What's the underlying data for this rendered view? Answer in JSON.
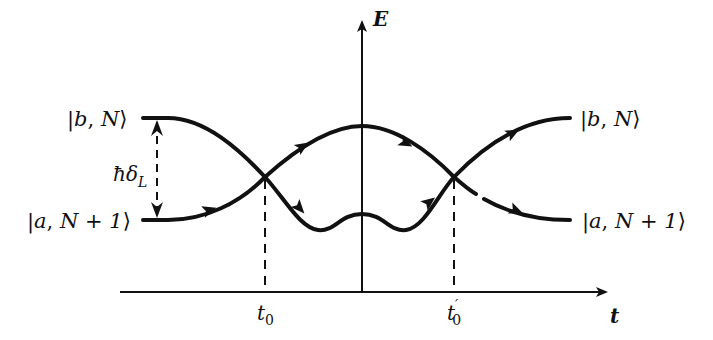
{
  "diagram": {
    "type": "energy-level-crossing",
    "axes": {
      "y_label": "E",
      "x_label": "t"
    },
    "time_markers": [
      {
        "label": "t",
        "subscript": "0",
        "prime": ""
      },
      {
        "label": "t",
        "subscript": "0",
        "prime": "′"
      }
    ],
    "left_states": {
      "upper": {
        "bar_left": "|",
        "var": "b",
        "sep": ", ",
        "n": "N",
        "close": "⟩"
      },
      "lower": {
        "bar_left": "|",
        "var": "a",
        "sep": ", ",
        "n": "N + 1",
        "close": "⟩"
      }
    },
    "right_states": {
      "upper": {
        "bar_left": "|",
        "var": "b",
        "sep": ", ",
        "n": "N",
        "close": "⟩"
      },
      "lower": {
        "bar_left": "|",
        "var": "a",
        "sep": ", ",
        "n": "N + 1",
        "close": "⟩"
      }
    },
    "gap_label": {
      "hbar": "ħ",
      "delta": "δ",
      "subscript": "L"
    },
    "colors": {
      "ink": "#111111",
      "background": "#ffffff"
    }
  }
}
